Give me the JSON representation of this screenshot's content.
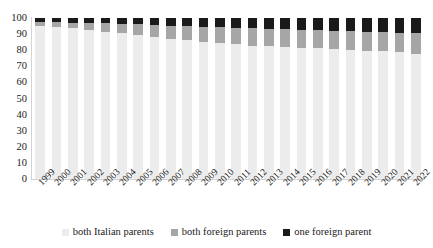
{
  "chart_data": {
    "type": "bar",
    "subtype": "stacked-100-percent",
    "title": "",
    "subtitle": "",
    "xlabel": "",
    "ylabel": "",
    "ylim": [
      0,
      100
    ],
    "yticks": [
      100,
      90,
      80,
      70,
      60,
      50,
      40,
      30,
      20,
      10,
      0
    ],
    "grid": false,
    "legend_position": "bottom",
    "categories": [
      "1999",
      "2000",
      "2001",
      "2002",
      "2003",
      "2004",
      "2005",
      "2006",
      "2007",
      "2008",
      "2009",
      "2010",
      "2011",
      "2012",
      "2013",
      "2014",
      "2015",
      "2016",
      "2017",
      "2018",
      "2019",
      "2020",
      "2021",
      "2022"
    ],
    "series": [
      {
        "name": "both Italian parents",
        "color": "#ececec",
        "values": [
          95.0,
          94.3,
          93.6,
          92.7,
          91.6,
          90.6,
          89.6,
          88.5,
          87.2,
          86.3,
          85.4,
          84.5,
          83.6,
          82.9,
          82.4,
          82.0,
          81.6,
          81.2,
          80.8,
          80.3,
          79.8,
          79.3,
          78.6,
          77.9
        ]
      },
      {
        "name": "both foreign parents",
        "color": "#a6a6a6",
        "values": [
          2.6,
          3.1,
          3.6,
          4.2,
          5.0,
          5.7,
          6.4,
          7.2,
          8.1,
          8.7,
          9.3,
          9.8,
          10.3,
          10.6,
          10.8,
          10.9,
          11.0,
          11.1,
          11.2,
          11.4,
          11.6,
          11.8,
          12.1,
          12.5
        ]
      },
      {
        "name": "one foreign parent",
        "color": "#1a1a1a",
        "values": [
          2.4,
          2.6,
          2.8,
          3.1,
          3.4,
          3.7,
          4.0,
          4.3,
          4.7,
          5.0,
          5.3,
          5.7,
          6.1,
          6.5,
          6.8,
          7.1,
          7.4,
          7.7,
          8.0,
          8.3,
          8.6,
          8.9,
          9.3,
          9.6
        ]
      }
    ]
  },
  "yaxis": {
    "ticks": [
      "100",
      "90",
      "80",
      "70",
      "60",
      "50",
      "40",
      "30",
      "20",
      "10",
      "0"
    ]
  },
  "xaxis": {
    "ticks": [
      "1999",
      "2000",
      "2001",
      "2002",
      "2003",
      "2004",
      "2005",
      "2006",
      "2007",
      "2008",
      "2009",
      "2010",
      "2011",
      "2012",
      "2013",
      "2014",
      "2015",
      "2016",
      "2017",
      "2018",
      "2019",
      "2020",
      "2021",
      "2022"
    ]
  },
  "legend": {
    "items": [
      {
        "label": "both Italian parents",
        "color": "#ececec"
      },
      {
        "label": "both foreign parents",
        "color": "#a6a6a6"
      },
      {
        "label": "one foreign parent",
        "color": "#1a1a1a"
      }
    ]
  }
}
